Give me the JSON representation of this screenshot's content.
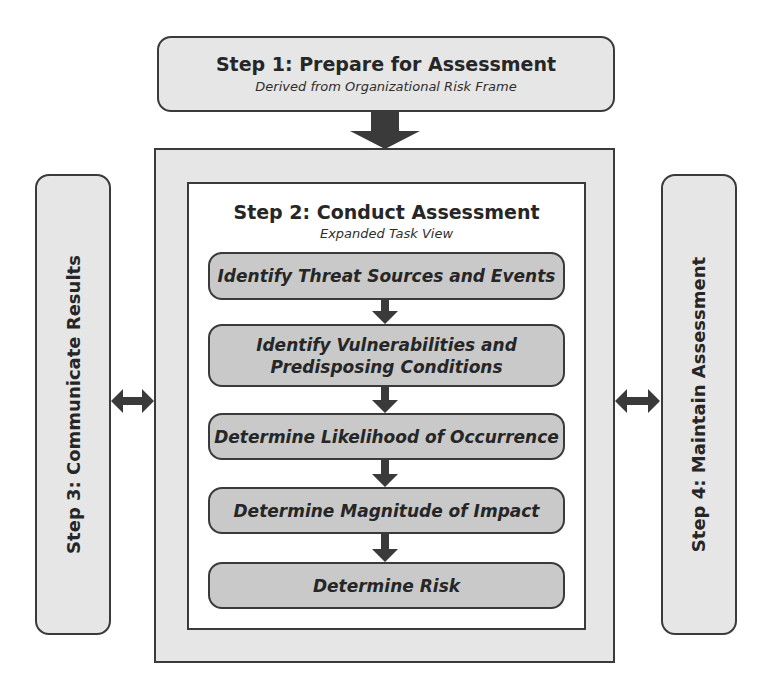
{
  "diagram": {
    "step1": {
      "title": "Step 1: Prepare for Assessment",
      "subtitle": "Derived from Organizational Risk Frame"
    },
    "step2": {
      "title": "Step 2: Conduct Assessment",
      "subtitle": "Expanded Task View",
      "tasks": [
        {
          "line1": "Identify Threat Sources and Events",
          "line2": ""
        },
        {
          "line1": "Identify Vulnerabilities and",
          "line2": "Predisposing Conditions"
        },
        {
          "line1": "Determine Likelihood of Occurrence",
          "line2": ""
        },
        {
          "line1": "Determine Magnitude of Impact",
          "line2": ""
        },
        {
          "line1": "Determine Risk",
          "line2": ""
        }
      ]
    },
    "step3": {
      "title": "Step 3: Communicate Results"
    },
    "step4": {
      "title": "Step 4: Maintain Assessment"
    },
    "colors": {
      "light_fill": "#e6e6e6",
      "task_fill": "#c9c9c9",
      "stroke": "#3a3a3a",
      "arrow": "#3a3a3a"
    }
  }
}
